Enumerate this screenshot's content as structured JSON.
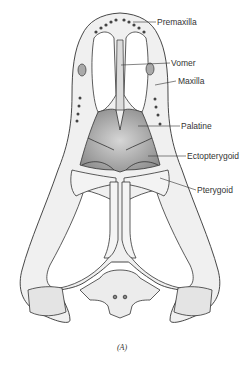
{
  "figure": {
    "caption": "(A)",
    "labels": [
      {
        "id": "premaxilla",
        "text": "Premaxilla",
        "x": 156,
        "y": 18
      },
      {
        "id": "vomer",
        "text": "Vomer",
        "x": 171,
        "y": 59
      },
      {
        "id": "maxilla",
        "text": "Maxilla",
        "x": 178,
        "y": 77
      },
      {
        "id": "palatine",
        "text": "Palatine",
        "x": 181,
        "y": 122
      },
      {
        "id": "ectopterygoid",
        "text": "Ectopterygoid",
        "x": 187,
        "y": 152
      },
      {
        "id": "pterygoid",
        "text": "Pterygoid",
        "x": 198,
        "y": 186
      }
    ]
  },
  "colors": {
    "ink": "#333333",
    "bone_fill": "#efefef",
    "shade": "#9a9a9a",
    "background": "#ffffff"
  }
}
